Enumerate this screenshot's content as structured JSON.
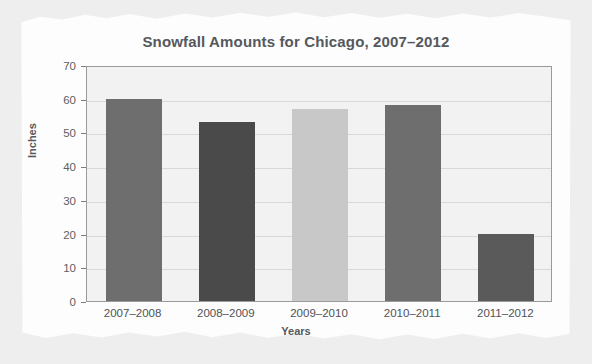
{
  "chart_data": {
    "type": "bar",
    "title": "Snowfall Amounts for Chicago, 2007–2012",
    "xlabel": "Years",
    "ylabel": "Inches",
    "categories": [
      "2007–2008",
      "2008–2009",
      "2009–2010",
      "2010–2011",
      "2011–2012"
    ],
    "values": [
      60,
      53,
      57,
      58,
      20
    ],
    "bar_colors": [
      "#6e6e6e",
      "#4a4a4a",
      "#c8c8c8",
      "#6e6e6e",
      "#5a5a5a"
    ],
    "ylim": [
      0,
      70
    ],
    "ytick_values": [
      0,
      10,
      20,
      30,
      40,
      50,
      60,
      70
    ],
    "ytick_labels": [
      "0",
      "10",
      "20",
      "30",
      "40",
      "50",
      "60",
      "70"
    ],
    "grid": true,
    "legend": null,
    "plot_background": "#f2f2f2",
    "page_background": "#eeeeee",
    "paper_color": "#fdfdfd"
  }
}
